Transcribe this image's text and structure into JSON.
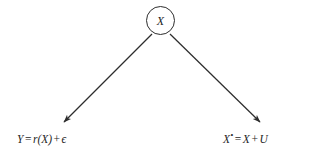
{
  "diagram": {
    "background_color": "#ffffff",
    "stroke_color": "#2d2d2d",
    "text_color": "#1e1e1e",
    "node": {
      "shape": "circle",
      "label": "X",
      "center_x": 161,
      "center_y": 21,
      "radius": 14
    },
    "edges": [
      {
        "name": "edge-to-outcome",
        "from_x": 152,
        "from_y": 34,
        "to_x": 64,
        "to_y": 122,
        "arrowhead": "filled-triangle"
      },
      {
        "name": "edge-to-measurement",
        "from_x": 170,
        "from_y": 34,
        "to_x": 260,
        "to_y": 122,
        "arrowhead": "filled-triangle"
      }
    ],
    "equations": {
      "left": {
        "lhs": "Y",
        "equals": "=",
        "fn": "r",
        "open_paren": "(",
        "arg": "X",
        "close_paren": ")",
        "plus": "+",
        "noise": "ϵ",
        "full_text": "Y = r(X) + ϵ"
      },
      "right": {
        "lhs": "X",
        "superscript": "•",
        "equals": "=",
        "term1": "X",
        "plus": "+",
        "term2": "U",
        "full_text": "X• = X + U"
      }
    }
  }
}
